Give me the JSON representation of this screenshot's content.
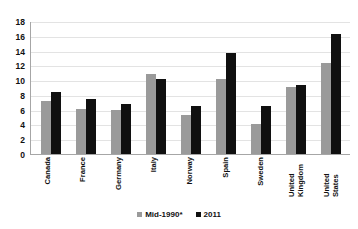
{
  "chart_data": {
    "type": "bar",
    "title": "",
    "subtitle": "",
    "xlabel": "",
    "ylabel": "",
    "ylim": [
      0,
      18
    ],
    "ytick_step": 2,
    "yticks": [
      0,
      2,
      4,
      6,
      8,
      10,
      12,
      14,
      16,
      18
    ],
    "grid": true,
    "legend_position": "bottom-center",
    "categories": [
      "Canada",
      "France",
      "Germany",
      "Italy",
      "Norway",
      "Spain",
      "Sweden",
      "United Kingdom",
      "United States"
    ],
    "series": [
      {
        "name": "Mid-1990*",
        "color": "#9a9a9a",
        "values": [
          7.2,
          6.1,
          5.9,
          10.8,
          5.3,
          10.1,
          4.1,
          9.1,
          12.3
        ]
      },
      {
        "name": "2011",
        "color": "#101010",
        "values": [
          8.4,
          7.4,
          6.8,
          10.1,
          6.5,
          13.7,
          6.5,
          9.4,
          16.2
        ]
      }
    ],
    "annotations": []
  },
  "legend": {
    "items": [
      {
        "label": "Mid-1990*",
        "swatch": "gray-swatch-icon"
      },
      {
        "label": "2011",
        "swatch": "black-swatch-icon"
      }
    ]
  }
}
